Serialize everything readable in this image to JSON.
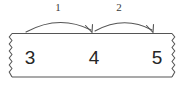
{
  "diagram": {
    "type": "number-line-jump-diagram",
    "strip": {
      "name": "number-strip",
      "numbers": [
        "3",
        "4",
        "5"
      ],
      "left_edge_style": "torn-zigzag",
      "right_edge_style": "torn-zigzag",
      "border_color": "#555555",
      "fill_color": "#ffffff"
    },
    "hops": [
      {
        "label": "1",
        "from": "3",
        "to": "4",
        "direction": "right",
        "color": "#555555"
      },
      {
        "label": "2",
        "from": "4",
        "to": "5",
        "direction": "right",
        "color": "#555555"
      }
    ],
    "colors": {
      "ink": "#262626",
      "line": "#555555",
      "label": "#3a3a3a",
      "background": "#ffffff"
    }
  }
}
